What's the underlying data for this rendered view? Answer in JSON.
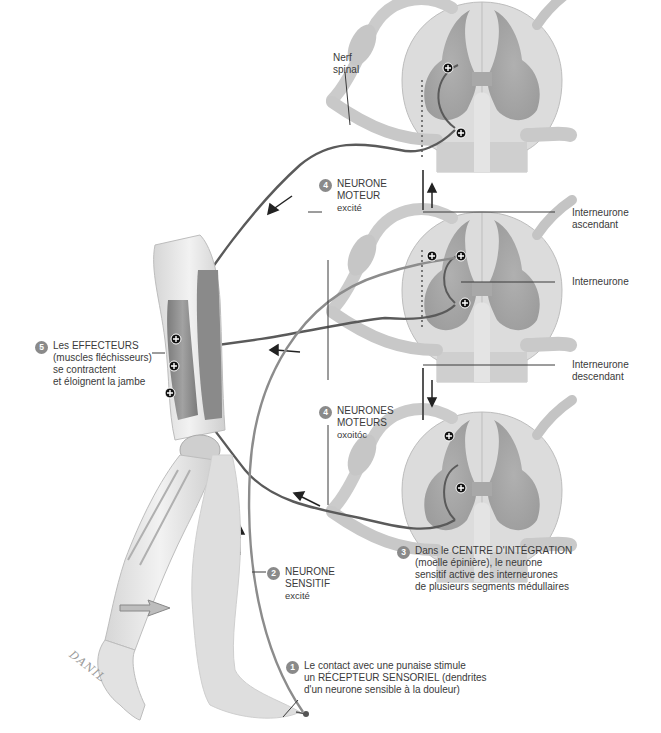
{
  "diagram": {
    "title_language": "fr",
    "colors": {
      "background": "#ffffff",
      "spinal_cord_white_matter": "#d9d9d9",
      "spinal_cord_gray_matter": "#a9a9a9",
      "nerve": "#c9c9c9",
      "motor_neuron": "#5a5a5a",
      "sensory_neuron": "#8c8c8c",
      "muscle": "#8f8f8f",
      "skin": "#e6e6e6",
      "badge": "#8a8a8a",
      "text": "#3a3a3a"
    },
    "labels": {
      "nerf_spinal": [
        "Nerf",
        "spinal"
      ],
      "interneurone_ascendant": [
        "Interneurone",
        "ascendant"
      ],
      "interneurone": [
        "Interneurone"
      ],
      "interneurone_descendant": [
        "Interneurone",
        "descendant"
      ],
      "signature": "DANIL"
    },
    "steps": [
      {
        "number": "1",
        "lines": [
          "Le contact avec une punaise stimule",
          "un RÉCEPTEUR SENSORIEL (dendrites",
          "d'un neurone sensible à la douleur)"
        ]
      },
      {
        "number": "2",
        "lines": [
          "NEURONE",
          "SENSITIF",
          "excité"
        ]
      },
      {
        "number": "3",
        "lines": [
          "Dans le CENTRE D'INTÉGRATION",
          "(moelle épinière), le neurone",
          "sensitif active des interneurones",
          "de plusieurs segments médullaires"
        ]
      },
      {
        "number": "4",
        "lines": [
          "NEURONE",
          "MOTEUR",
          "excité"
        ]
      },
      {
        "number": "4",
        "lines": [
          "NEURONES",
          "MOTEURS",
          "oxoitóc"
        ]
      },
      {
        "number": "5",
        "lines": [
          "Les EFFECTEURS",
          "(muscles fléchisseurs)",
          "se contractent",
          "et éloignent la jambe"
        ]
      }
    ],
    "synapse_symbol": "+",
    "spinal_segments": [
      "upper",
      "middle",
      "lower"
    ]
  }
}
